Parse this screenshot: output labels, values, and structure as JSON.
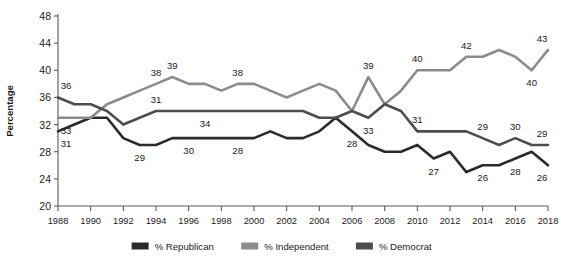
{
  "chart_data": {
    "type": "line",
    "title": "",
    "subtitle": "",
    "xlabel": "",
    "ylabel": "Percentage",
    "xlim": [
      1988,
      2018
    ],
    "ylim": [
      20,
      48
    ],
    "grid": false,
    "legend_position": "bottom",
    "x": [
      1988,
      1989,
      1990,
      1991,
      1992,
      1993,
      1994,
      1995,
      1996,
      1997,
      1998,
      1999,
      2000,
      2001,
      2002,
      2003,
      2004,
      2005,
      2006,
      2007,
      2008,
      2009,
      2010,
      2011,
      2012,
      2013,
      2014,
      2015,
      2016,
      2017,
      2018
    ],
    "xticks": [
      1988,
      1990,
      1992,
      1994,
      1996,
      1998,
      2000,
      2002,
      2004,
      2006,
      2008,
      2010,
      2012,
      2014,
      2016,
      2018
    ],
    "xtick_labels": [
      "1988",
      "1990",
      "1992",
      "1994",
      "1996",
      "1998",
      "2000",
      "2002",
      "2004",
      "2006",
      "2008",
      "2010",
      "2012",
      "2014",
      "2016",
      "2018"
    ],
    "yticks": [
      20,
      24,
      28,
      32,
      36,
      40,
      44,
      48
    ],
    "ytick_labels": [
      "20",
      "24",
      "28",
      "32",
      "36",
      "40",
      "44",
      "48"
    ],
    "series": [
      {
        "name": "% Republican",
        "color": "#2b2b2b",
        "values": [
          31,
          32,
          33,
          33,
          30,
          29,
          29,
          30,
          30,
          30,
          30,
          30,
          30,
          31,
          30,
          30,
          31,
          33,
          31,
          29,
          28,
          28,
          29,
          27,
          28,
          25,
          26,
          26,
          27,
          28,
          26
        ],
        "labels": [
          {
            "x": 1988,
            "value": 31,
            "position": "below"
          },
          {
            "x": 1993,
            "value": 29,
            "position": "below"
          },
          {
            "x": 1996,
            "value": 30,
            "position": "below"
          },
          {
            "x": 1999,
            "value": 28,
            "position": "below"
          },
          {
            "x": 2006,
            "value": 28,
            "position": "below"
          },
          {
            "x": 2011,
            "value": 27,
            "position": "below"
          },
          {
            "x": 2014,
            "value": 26,
            "position": "below"
          },
          {
            "x": 2016,
            "value": 28,
            "position": "below"
          },
          {
            "x": 2018,
            "value": 26,
            "position": "below"
          }
        ]
      },
      {
        "name": "% Independent",
        "color": "#8c8c8c",
        "values": [
          33,
          33,
          33,
          35,
          36,
          37,
          38,
          39,
          38,
          38,
          37,
          38,
          38,
          37,
          36,
          37,
          38,
          37,
          34,
          39,
          35,
          37,
          40,
          40,
          40,
          42,
          42,
          43,
          42,
          40,
          43
        ],
        "labels": [
          {
            "x": 1988,
            "value": 33,
            "position": "below"
          },
          {
            "x": 1994,
            "value": 38,
            "position": "above"
          },
          {
            "x": 1995,
            "value": 39,
            "position": "above"
          },
          {
            "x": 1999,
            "value": 38,
            "position": "above"
          },
          {
            "x": 2007,
            "value": 39,
            "position": "above"
          },
          {
            "x": 2010,
            "value": 40,
            "position": "above"
          },
          {
            "x": 2013,
            "value": 42,
            "position": "above"
          },
          {
            "x": 2017,
            "value": 40,
            "position": "below"
          },
          {
            "x": 2018,
            "value": 43,
            "position": "above"
          }
        ]
      },
      {
        "name": "% Democrat",
        "color": "#4d4d4d",
        "values": [
          36,
          35,
          35,
          34,
          32,
          33,
          34,
          34,
          34,
          34,
          34,
          34,
          34,
          34,
          34,
          34,
          33,
          33,
          34,
          33,
          35,
          34,
          31,
          31,
          31,
          31,
          30,
          29,
          30,
          29,
          29
        ],
        "labels": [
          {
            "x": 1988,
            "value": 36,
            "position": "above"
          },
          {
            "x": 1994,
            "value": 31,
            "position": "above"
          },
          {
            "x": 1997,
            "value": 34,
            "position": "below"
          },
          {
            "x": 2010,
            "value": 31,
            "position": "above"
          },
          {
            "x": 2007,
            "value": 33,
            "position": "below"
          },
          {
            "x": 2014,
            "value": 29,
            "position": "above"
          },
          {
            "x": 2016,
            "value": 30,
            "position": "above"
          },
          {
            "x": 2018,
            "value": 29,
            "position": "above"
          }
        ]
      }
    ],
    "legend": [
      {
        "label": "% Republican",
        "color": "#2b2b2b"
      },
      {
        "label": "% Independent",
        "color": "#8c8c8c"
      },
      {
        "label": "% Democrat",
        "color": "#4d4d4d"
      }
    ]
  }
}
